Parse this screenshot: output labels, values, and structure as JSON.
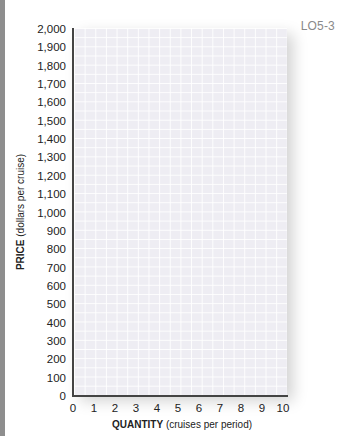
{
  "header": {
    "objective_tag": "LO5-3"
  },
  "chart_data": {
    "type": "line",
    "title": "",
    "xlabel_bold": "QUANTITY",
    "xlabel_rest": "(cruises per period)",
    "ylabel_bold": "PRICE",
    "ylabel_rest": "(dollars per cruise)",
    "xlim": [
      0,
      10
    ],
    "ylim": [
      0,
      2000
    ],
    "grid": true,
    "x_ticks": [
      "0",
      "1",
      "2",
      "3",
      "4",
      "5",
      "6",
      "7",
      "8",
      "9",
      "10"
    ],
    "y_ticks": [
      "0",
      "100",
      "200",
      "300",
      "400",
      "500",
      "600",
      "700",
      "800",
      "900",
      "1,000",
      "1,100",
      "1,200",
      "1,300",
      "1,400",
      "1,500",
      "1,600",
      "1,700",
      "1,800",
      "1,900",
      "2,000"
    ],
    "series": []
  }
}
